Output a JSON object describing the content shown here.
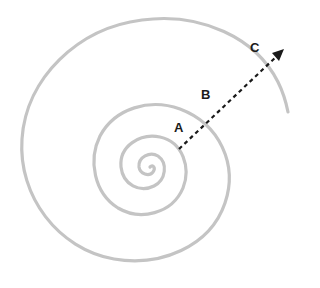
{
  "diagram": {
    "type": "spiral",
    "spiral_color": "#c4c4c4",
    "arrow_color": "#1a1a1a",
    "labels": [
      {
        "id": "A",
        "text": "A",
        "x": 174,
        "y": 120
      },
      {
        "id": "B",
        "text": "B",
        "x": 201,
        "y": 87
      },
      {
        "id": "C",
        "text": "C",
        "x": 250,
        "y": 40
      }
    ],
    "arrow": {
      "style": "dashed",
      "from": [
        179,
        149
      ],
      "to": [
        283,
        50
      ]
    }
  }
}
